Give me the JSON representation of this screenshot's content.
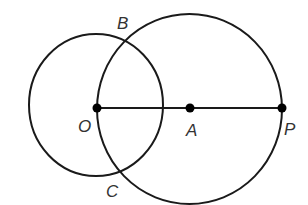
{
  "diagram": {
    "type": "geometry",
    "stroke_color": "#1a1a1a",
    "label_color": "#333333",
    "circles": [
      {
        "name": "circle-O",
        "center": "O",
        "cx": 96,
        "cy": 105,
        "rx": 67,
        "ry": 71
      },
      {
        "name": "circle-A",
        "center": "A",
        "cx": 189.5,
        "cy": 109,
        "rx": 92.5,
        "ry": 95
      }
    ],
    "segment": {
      "from": "O",
      "to": "P"
    },
    "points": [
      {
        "id": "O",
        "x": 97,
        "y": 108,
        "dot": true
      },
      {
        "id": "A",
        "x": 190,
        "y": 108,
        "dot": true
      },
      {
        "id": "P",
        "x": 282,
        "y": 108,
        "dot": true
      },
      {
        "id": "B",
        "x": 125,
        "y": 39,
        "dot": false
      },
      {
        "id": "C",
        "x": 117,
        "y": 174,
        "dot": false
      }
    ],
    "labels": {
      "B": "B",
      "O": "O",
      "A": "A",
      "P": "P",
      "C": "C"
    }
  }
}
